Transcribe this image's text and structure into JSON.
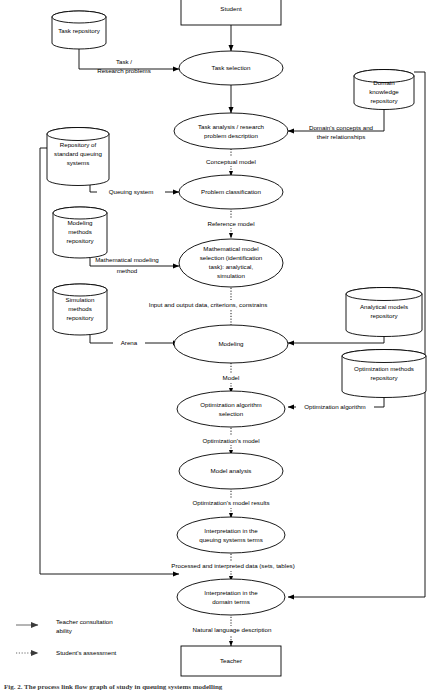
{
  "diagram": {
    "colors": {
      "stroke": "#000000",
      "background": "#ffffff",
      "legend_stroke": "#6a6a6a",
      "caption": "#3a3a3a"
    },
    "terminators": [
      {
        "id": "student",
        "label": "Student",
        "shape": "rectangle"
      },
      {
        "id": "teacher",
        "label": "Teacher",
        "shape": "rectangle"
      }
    ],
    "processes": [
      {
        "id": "task-selection",
        "lines": [
          "Task selection"
        ]
      },
      {
        "id": "task-analysis",
        "lines": [
          "Task analysis / research",
          "problem description"
        ]
      },
      {
        "id": "problem-classification",
        "lines": [
          "Problem classification"
        ]
      },
      {
        "id": "math-model-selection",
        "lines": [
          "Mathematical model",
          "selection (identification",
          "task): analytical,",
          "simulation"
        ]
      },
      {
        "id": "modeling",
        "lines": [
          "Modeling"
        ]
      },
      {
        "id": "optimization-algorithm-selection",
        "lines": [
          "Optimization algorithm",
          "selection"
        ]
      },
      {
        "id": "model-analysis",
        "lines": [
          "Model analysis"
        ]
      },
      {
        "id": "interpretation-queuing",
        "lines": [
          "Interpretation in the",
          "queuing systems terms"
        ]
      },
      {
        "id": "interpretation-domain",
        "lines": [
          "Interpretation in the",
          "domain terms"
        ]
      }
    ],
    "repositories": [
      {
        "id": "task-repository",
        "lines": [
          "Task repository"
        ]
      },
      {
        "id": "domain-knowledge-repository",
        "lines": [
          "Domain",
          "knowledge",
          "repository"
        ]
      },
      {
        "id": "standard-queuing-repository",
        "lines": [
          "Repository of",
          "standard queuing",
          "systems"
        ]
      },
      {
        "id": "modeling-methods-repository",
        "lines": [
          "Modeling",
          "methods",
          "repository"
        ]
      },
      {
        "id": "simulation-methods-repository",
        "lines": [
          "Simulation",
          "methods",
          "repository"
        ]
      },
      {
        "id": "analytical-models-repository",
        "lines": [
          "Analytical models",
          "repository"
        ]
      },
      {
        "id": "optimization-methods-repository",
        "lines": [
          "Optimization methods",
          "repository"
        ]
      }
    ],
    "edge_labels": [
      {
        "id": "task-research-problems",
        "lines": [
          "Task /",
          "Research problems"
        ]
      },
      {
        "id": "domains-concepts",
        "lines": [
          "Domain's concepts and",
          "their relationships"
        ]
      },
      {
        "id": "conceptual-model",
        "lines": [
          "Conceptual model"
        ]
      },
      {
        "id": "queuing-system",
        "lines": [
          "Queuing system"
        ]
      },
      {
        "id": "reference-model",
        "lines": [
          "Reference model"
        ]
      },
      {
        "id": "mathematical-modeling-method",
        "lines": [
          "Mathematical modeling",
          "method"
        ]
      },
      {
        "id": "input-output-data",
        "lines": [
          "Input and output data, criterions, constrains"
        ]
      },
      {
        "id": "arena",
        "lines": [
          "Arena"
        ]
      },
      {
        "id": "model",
        "lines": [
          "Model"
        ]
      },
      {
        "id": "optimization-algorithm",
        "lines": [
          "Optimization algorithm"
        ]
      },
      {
        "id": "optimizations-model",
        "lines": [
          "Optimization's model"
        ]
      },
      {
        "id": "optimizations-model-results",
        "lines": [
          "Optimization's model results"
        ]
      },
      {
        "id": "processed-interpreted-data",
        "lines": [
          "Processed and interpreted data (sets, tables)"
        ]
      },
      {
        "id": "natural-language-description",
        "lines": [
          "Natural language description"
        ]
      }
    ],
    "legend": [
      {
        "id": "teacher-consultation",
        "style": "solid",
        "lines": [
          "Teacher consultation",
          "ability"
        ]
      },
      {
        "id": "students-assessment",
        "style": "dotted",
        "lines": [
          "Student's assessment"
        ]
      }
    ],
    "caption": "Fig. 2. The process link flow graph of study in queuing systems modelling"
  }
}
